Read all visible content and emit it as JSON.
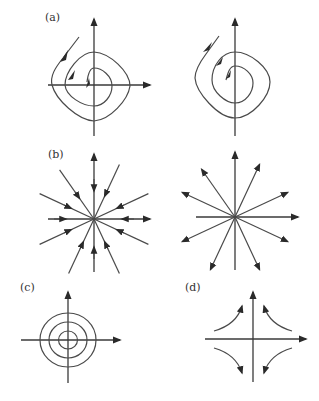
{
  "figure": {
    "panels": [
      {
        "id": "a-left",
        "label": "(a)",
        "type": "stable-spiral",
        "flow": "inward",
        "axes": [
          "x",
          "y"
        ]
      },
      {
        "id": "a-right",
        "label": "",
        "type": "unstable-spiral",
        "flow": "outward",
        "axes": [
          "y"
        ]
      },
      {
        "id": "b-left",
        "label": "(b)",
        "type": "stable-star-node",
        "flow": "inward",
        "rays": 12
      },
      {
        "id": "b-right",
        "label": "",
        "type": "unstable-star-node",
        "flow": "outward",
        "rays": 12
      },
      {
        "id": "c",
        "label": "(c)",
        "type": "center",
        "flow": "closed-orbits",
        "orbits": 3
      },
      {
        "id": "d",
        "label": "(d)",
        "type": "saddle",
        "flow": "hyperbolic",
        "branches": 4
      }
    ],
    "colors": {
      "stroke": "#3a3a3a",
      "background": "#ffffff"
    }
  }
}
